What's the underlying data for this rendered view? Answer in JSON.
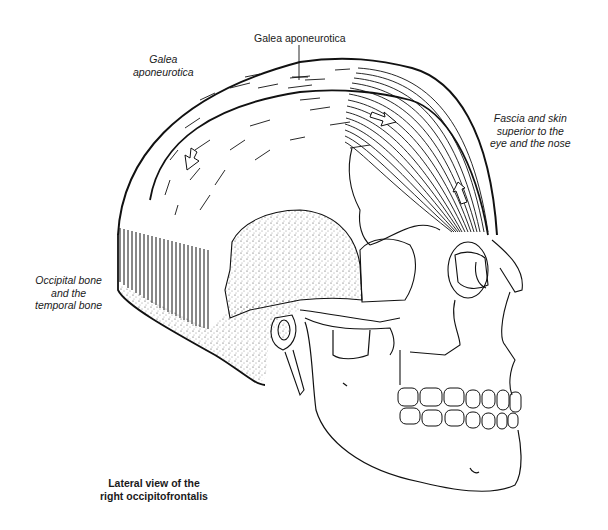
{
  "figure": {
    "subject": "Lateral view of the right occipitofrontalis",
    "caption": {
      "line1": "Lateral view of the",
      "line2": "right occipitofrontalis"
    },
    "labels": {
      "galea_top": "Galea aponeurotica",
      "galea_left": {
        "line1": "Galea",
        "line2": "aponeurotica"
      },
      "fascia": {
        "line1": "Fascia and skin",
        "line2": "superior to the",
        "line3": "eye and the nose"
      },
      "occipital": {
        "line1": "Occipital bone",
        "line2": "and the",
        "line3": "temporal bone"
      }
    },
    "structures": [
      "galea-aponeurotica",
      "frontal-belly",
      "occipital-belly",
      "skull",
      "mandible",
      "teeth",
      "orbit",
      "ear-canal",
      "styloid-process",
      "muscle-pull-arrows"
    ],
    "colors": {
      "ink": "#111111",
      "background": "#ffffff",
      "text": "#1a1a1a"
    }
  }
}
